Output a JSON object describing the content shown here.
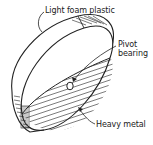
{
  "diagram": {
    "labels": {
      "foam": "Light foam plastic",
      "pivot": "Pivot",
      "bearing": "bearing",
      "metal": "Heavy metal"
    },
    "colors": {
      "line": "#222222",
      "background": "#ffffff"
    }
  }
}
